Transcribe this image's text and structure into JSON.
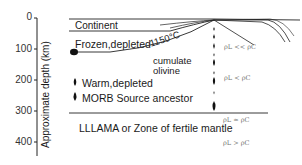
{
  "diagram": {
    "yaxis": {
      "label": "Approximate depth (km)",
      "ticks": [
        "0",
        "100",
        "200",
        "300",
        "400"
      ]
    },
    "regions": {
      "continent": "Continent",
      "frozen": "Frozen,depleted",
      "isotherm": "1150°C",
      "cumulate": "cumulate",
      "olivine": "olivine",
      "warm": "Warm,depleted",
      "morb": "MORB Source ancestor",
      "lllama": "LLLAMA or Zone of fertile mantle"
    },
    "density_labels": [
      "ρL << ρC",
      "ρL < ρC",
      "ρL ≃ ρC",
      "ρL > ρC"
    ]
  }
}
